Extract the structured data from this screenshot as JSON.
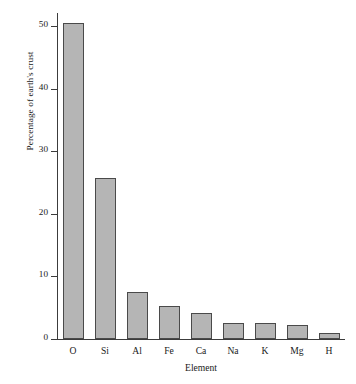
{
  "chart_data": {
    "type": "bar",
    "title": "",
    "xlabel": "Element",
    "ylabel": "Percentage of earth's crust",
    "categories": [
      "O",
      "Si",
      "Al",
      "Fe",
      "Ca",
      "Na",
      "K",
      "Mg",
      "H"
    ],
    "values": [
      50.5,
      25.7,
      7.5,
      5.2,
      4.1,
      2.6,
      2.5,
      2.2,
      1.0
    ],
    "ylim": [
      0,
      50
    ],
    "yticks": [
      0,
      10,
      20,
      30,
      40,
      50
    ],
    "ytick_labels": [
      "0",
      "10",
      "20",
      "30",
      "40",
      "50"
    ],
    "grid": false,
    "legend": null,
    "bar_fill_color": "#b5b5b5",
    "bar_edge_color": "#4a4a4a",
    "axis_color": "#3c3c3c",
    "background_color": "#ffffff"
  }
}
